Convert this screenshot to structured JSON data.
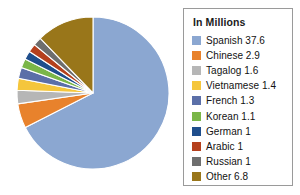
{
  "chart_data": {
    "type": "pie",
    "title": "",
    "legend_title": "In Millions",
    "legend_position": "right",
    "unit": "millions",
    "total": 55.8,
    "categories": [
      "Spanish",
      "Chinese",
      "Tagalog",
      "Vietnamese",
      "French",
      "Korean",
      "German",
      "Arabic",
      "Russian",
      "Other"
    ],
    "values": [
      37.6,
      2.9,
      1.6,
      1.4,
      1.3,
      1.1,
      1,
      1,
      1,
      6.8
    ],
    "labels": [
      "Spanish 37.6",
      "Chinese 2.9",
      "Tagalog 1.6",
      "Vietnamese 1.4",
      "French 1.3",
      "Korean 1.1",
      "German 1",
      "Arabic 1",
      "Russian 1",
      "Other 6.8"
    ],
    "colors": [
      "#8ba7d1",
      "#e8822c",
      "#b6b6b6",
      "#f6c githubG"
    ],
    "slice_colors": [
      "#8ba7d1",
      "#e8822c",
      "#b6b6b6",
      "#f5c63c",
      "#5b6fa8",
      "#7ab648",
      "#1f4e8c",
      "#b5401d",
      "#6e6e6e",
      "#99761a"
    ],
    "start_angle": 0,
    "direction": "clockwise",
    "grid": false
  },
  "legend": {
    "title": "In Millions",
    "items": [
      {
        "label": "Spanish 37.6",
        "color": "#8ba7d1",
        "name": "Spanish",
        "value": 37.6
      },
      {
        "label": "Chinese 2.9",
        "color": "#e8822c",
        "name": "Chinese",
        "value": 2.9
      },
      {
        "label": "Tagalog 1.6",
        "color": "#b6b6b6",
        "name": "Tagalog",
        "value": 1.6
      },
      {
        "label": "Vietnamese 1.4",
        "color": "#f5c63c",
        "name": "Vietnamese",
        "value": 1.4
      },
      {
        "label": "French 1.3",
        "color": "#5b6fa8",
        "name": "French",
        "value": 1.3
      },
      {
        "label": "Korean 1.1",
        "color": "#7ab648",
        "name": "Korean",
        "value": 1.1
      },
      {
        "label": "German 1",
        "color": "#1f4e8c",
        "name": "German",
        "value": 1
      },
      {
        "label": "Arabic 1",
        "color": "#b5401d",
        "name": "Arabic",
        "value": 1
      },
      {
        "label": "Russian 1",
        "color": "#6e6e6e",
        "name": "Russian",
        "value": 1
      },
      {
        "label": "Other 6.8",
        "color": "#99761a",
        "name": "Other",
        "value": 6.8
      }
    ],
    "border_color": "#9a9a9a",
    "background": "#ffffff"
  }
}
